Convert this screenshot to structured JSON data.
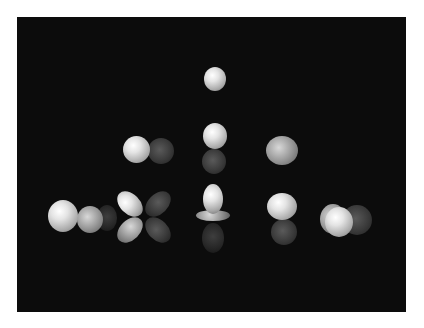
{
  "scene": {
    "description": "Rendered atomic orbitals arranged in a pyramid on black background",
    "background_color": "#0c0c0c",
    "page_color": "#ffffff",
    "rows": [
      {
        "label": "s",
        "orbitals": [
          "s"
        ]
      },
      {
        "label": "p",
        "orbitals": [
          "p-1",
          "p0",
          "p+1"
        ]
      },
      {
        "label": "d",
        "orbitals": [
          "d-2",
          "d-1",
          "d0",
          "d+1",
          "d+2"
        ]
      }
    ]
  }
}
